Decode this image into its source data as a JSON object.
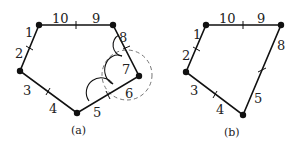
{
  "figures": [
    {
      "id": "a",
      "caption": "(a)",
      "vertex_count": 5,
      "segment_labels": [
        "1",
        "2",
        "3",
        "4",
        "5",
        "6",
        "7",
        "8",
        "9",
        "10"
      ],
      "has_dashed_circle": true,
      "arc_count": 3
    },
    {
      "id": "b",
      "caption": "(b)",
      "vertex_count": 4,
      "segment_labels": [
        "1",
        "2",
        "3",
        "4",
        "5",
        "8",
        "9",
        "10"
      ]
    }
  ],
  "colors": {
    "stroke": "#111111",
    "dashed": "#777777",
    "background": "#ffffff"
  }
}
